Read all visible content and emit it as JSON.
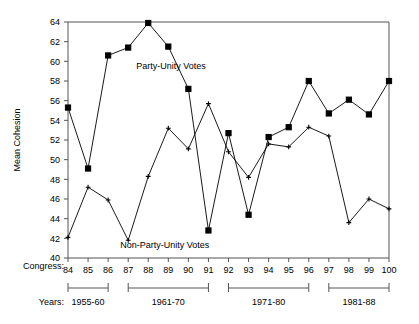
{
  "chart_data": {
    "type": "line",
    "title": "",
    "xlabel": "Congress",
    "ylabel": "Mean Cohesion",
    "x": [
      84,
      85,
      86,
      87,
      88,
      89,
      90,
      91,
      92,
      93,
      94,
      95,
      96,
      97,
      98,
      99,
      100
    ],
    "xlim": [
      84,
      100
    ],
    "ylim": [
      40,
      64
    ],
    "yticks": [
      40,
      42,
      44,
      46,
      48,
      50,
      52,
      54,
      56,
      58,
      60,
      62,
      64
    ],
    "grid": false,
    "legend_position": "inline-annotation",
    "series": [
      {
        "name": "Party-Unity Votes",
        "marker": "filled-square",
        "values": [
          55.3,
          49.1,
          60.6,
          61.4,
          63.9,
          61.5,
          57.2,
          42.8,
          52.7,
          44.4,
          52.3,
          53.3,
          58.0,
          54.7,
          56.1,
          54.6,
          58.0
        ]
      },
      {
        "name": "Non-Party-Unity Votes",
        "marker": "small-cross",
        "values": [
          42.1,
          47.2,
          45.9,
          41.8,
          48.3,
          53.2,
          51.1,
          55.7,
          50.8,
          48.2,
          51.6,
          51.3,
          53.3,
          52.4,
          43.6,
          46.0,
          45.0
        ]
      }
    ],
    "annotations": [
      {
        "name": "party-unity-label",
        "text": "Party-Unity Votes",
        "x": 87.4,
        "y": 59.2
      },
      {
        "name": "non-party-unity-label",
        "text": "Non-Party-Unity Votes",
        "x": 86.6,
        "y": 41.0
      }
    ],
    "eras": [
      {
        "label": "1955-60",
        "from": 84,
        "to": 86
      },
      {
        "label": "1961-70",
        "from": 87,
        "to": 91
      },
      {
        "label": "1971-80",
        "from": 92,
        "to": 96
      },
      {
        "label": "1981-88",
        "from": 97,
        "to": 100
      }
    ],
    "row_labels": {
      "congress": "Congress:",
      "years": "Years:"
    }
  }
}
